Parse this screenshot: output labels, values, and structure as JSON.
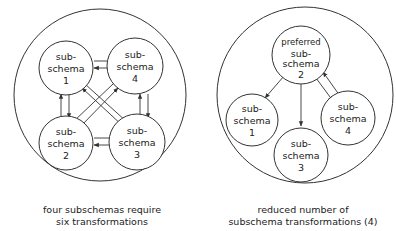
{
  "left_diagram": {
    "nodes": [
      {
        "id": "1",
        "lines": [
          "sub-",
          "schema",
          "1"
        ]
      },
      {
        "id": "4",
        "lines": [
          "sub-",
          "schema",
          "4"
        ]
      },
      {
        "id": "2",
        "lines": [
          "sub-",
          "schema",
          "2"
        ]
      },
      {
        "id": "3",
        "lines": [
          "sub-",
          "schema",
          "3"
        ]
      }
    ],
    "edges": [
      [
        "1",
        "4"
      ],
      [
        "1",
        "2"
      ],
      [
        "4",
        "3"
      ],
      [
        "2",
        "3"
      ],
      [
        "1",
        "3"
      ],
      [
        "4",
        "2"
      ]
    ],
    "caption": [
      "four subschemas require",
      "six transformations"
    ]
  },
  "right_diagram": {
    "nodes": [
      {
        "id": "2",
        "lines": [
          "preferred",
          "sub-",
          "schema",
          "2"
        ]
      },
      {
        "id": "1",
        "lines": [
          "sub-",
          "schema",
          "1"
        ]
      },
      {
        "id": "3",
        "lines": [
          "sub-",
          "schema",
          "3"
        ]
      },
      {
        "id": "4",
        "lines": [
          "sub-",
          "schema",
          "4"
        ]
      }
    ],
    "edges": [
      [
        "2",
        "1"
      ],
      [
        "2",
        "3"
      ],
      [
        "2",
        "4"
      ],
      [
        "4",
        "2"
      ]
    ],
    "caption": [
      "reduced number of",
      "subschema transformations (4)"
    ]
  }
}
